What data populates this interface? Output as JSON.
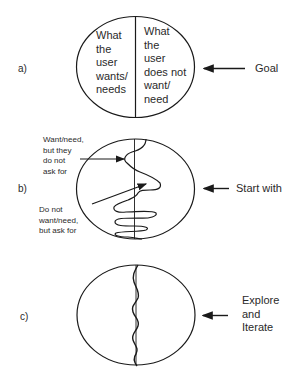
{
  "panels": [
    {
      "id": "a",
      "letter": "a)",
      "left_region": [
        "What",
        "the",
        "user",
        "wants/",
        "needs"
      ],
      "right_region": [
        "What",
        "the",
        "user",
        "does not",
        "want/",
        "need"
      ],
      "arrow_label": "Goal"
    },
    {
      "id": "b",
      "letter": "b)",
      "annotation_top": [
        "Want/need,",
        "but they",
        "do not",
        "ask for"
      ],
      "annotation_bottom": [
        "Do not",
        "want/need,",
        "but ask for"
      ],
      "arrow_label": "Start with"
    },
    {
      "id": "c",
      "letter": "c)",
      "arrow_label": [
        "Explore",
        "and",
        "Iterate"
      ]
    }
  ],
  "colors": {
    "stroke": "#1a1a1a",
    "text": "#2a2a2a",
    "background": "#ffffff"
  }
}
